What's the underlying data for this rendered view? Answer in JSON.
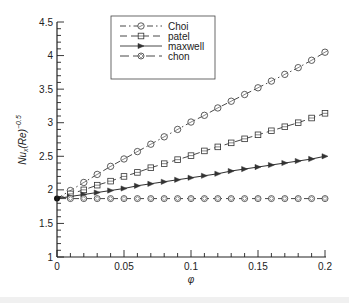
{
  "chart_data": {
    "type": "line",
    "title": "",
    "xlabel": "φ",
    "ylabel": "Nu_x(Re)^-0.5",
    "ylabel_parts": {
      "base": "Nu",
      "sub": "x",
      "mid": "(Re)",
      "sup": "−0.5"
    },
    "xlim": [
      0,
      0.2
    ],
    "ylim": [
      1,
      4.5
    ],
    "x_ticks": [
      "0",
      "0.05",
      "0.1",
      "0.15",
      "0.2"
    ],
    "x_tick_values": [
      0,
      0.05,
      0.1,
      0.15,
      0.2
    ],
    "y_ticks": [
      "1",
      "1.5",
      "2",
      "2.5",
      "3",
      "3.5",
      "4",
      "4.5"
    ],
    "y_tick_values": [
      1,
      1.5,
      2,
      2.5,
      3,
      3.5,
      4,
      4.5
    ],
    "x_minor_step": 0.01,
    "y_minor_step": 0.1,
    "grid": false,
    "legend_position": "upper-left-inside",
    "x": [
      0,
      0.01,
      0.02,
      0.03,
      0.04,
      0.05,
      0.06,
      0.07,
      0.08,
      0.09,
      0.1,
      0.11,
      0.12,
      0.13,
      0.14,
      0.15,
      0.16,
      0.17,
      0.18,
      0.19,
      0.2
    ],
    "series": [
      {
        "name": "Choi",
        "style": "dash-dot",
        "marker": "circle",
        "values": [
          1.87,
          1.99,
          2.11,
          2.23,
          2.35,
          2.46,
          2.57,
          2.68,
          2.79,
          2.9,
          3.01,
          3.11,
          3.22,
          3.32,
          3.42,
          3.52,
          3.62,
          3.72,
          3.82,
          3.93,
          4.05
        ]
      },
      {
        "name": "patel",
        "style": "dashed",
        "marker": "square",
        "values": [
          1.87,
          1.94,
          2.0,
          2.07,
          2.13,
          2.2,
          2.26,
          2.33,
          2.39,
          2.45,
          2.51,
          2.58,
          2.64,
          2.7,
          2.76,
          2.82,
          2.88,
          2.94,
          3.0,
          3.07,
          3.14
        ]
      },
      {
        "name": "maxwell",
        "style": "solid",
        "marker": "triangle-right",
        "values": [
          1.87,
          1.9,
          1.93,
          1.96,
          1.99,
          2.02,
          2.06,
          2.09,
          2.12,
          2.15,
          2.18,
          2.21,
          2.24,
          2.28,
          2.31,
          2.34,
          2.37,
          2.4,
          2.43,
          2.46,
          2.5
        ]
      },
      {
        "name": "chon",
        "style": "long-dash",
        "marker": "diamond-circle",
        "values": [
          1.87,
          1.87,
          1.87,
          1.87,
          1.87,
          1.87,
          1.87,
          1.87,
          1.87,
          1.87,
          1.87,
          1.87,
          1.87,
          1.87,
          1.87,
          1.87,
          1.87,
          1.87,
          1.87,
          1.87,
          1.87
        ]
      }
    ]
  },
  "colors": {
    "line": "#333333",
    "axis": "#222222",
    "legend_border": "#444444"
  }
}
